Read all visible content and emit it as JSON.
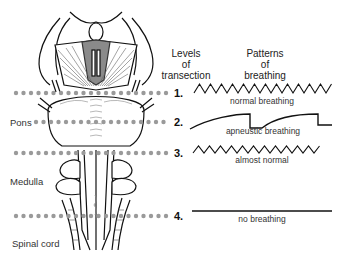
{
  "headers": {
    "levels": [
      "Levels",
      "of",
      "transection"
    ],
    "patterns": [
      "Patterns",
      "of",
      "breathing"
    ]
  },
  "regions": {
    "pons": "Pons",
    "medulla": "Medulla",
    "spinal_cord": "Spinal cord"
  },
  "levels": [
    {
      "number": "1.",
      "pattern": "normal breathing",
      "wave": "zigzag"
    },
    {
      "number": "2.",
      "pattern": "apneustic breathing",
      "wave": "apneustic"
    },
    {
      "number": "3.",
      "pattern": "almost normal",
      "wave": "zigzag"
    },
    {
      "number": "4.",
      "pattern": "no breathing",
      "wave": "flat"
    }
  ],
  "colors": {
    "dots": "#9a9a9a",
    "ink": "#111111",
    "shade": "#777777"
  }
}
